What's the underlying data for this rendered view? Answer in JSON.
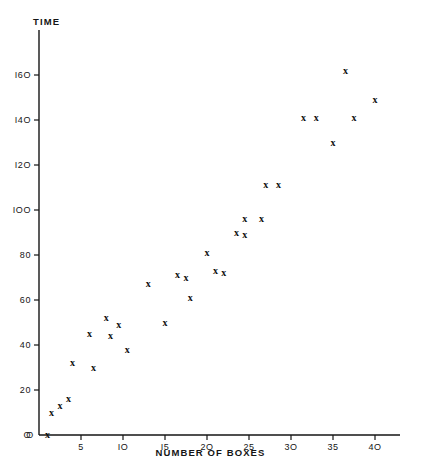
{
  "chart_data": {
    "type": "scatter",
    "title": "",
    "xlabel": "NUMBER OF BOXES",
    "ylabel": "TIME",
    "xlim": [
      0,
      43
    ],
    "ylim": [
      0,
      172
    ],
    "xticks": [
      0,
      5,
      10,
      15,
      20,
      25,
      30,
      35,
      40
    ],
    "xtick_labels": [
      "O",
      "5",
      "IO",
      "I5",
      "2O",
      "25",
      "3O",
      "35",
      "4O"
    ],
    "yticks": [
      0,
      20,
      40,
      60,
      80,
      100,
      120,
      140,
      160
    ],
    "ytick_labels": [
      "O",
      "20",
      "40",
      "60",
      "80",
      "IOO",
      "I2O",
      "I4O",
      "I6O"
    ],
    "grid": false,
    "legend": null,
    "marker": "x",
    "series": [
      {
        "name": "observations",
        "points": [
          [
            1.0,
            0.0
          ],
          [
            1.5,
            10.0
          ],
          [
            2.5,
            13.0
          ],
          [
            3.5,
            16.0
          ],
          [
            4.0,
            32.0
          ],
          [
            6.0,
            45.0
          ],
          [
            6.5,
            30.0
          ],
          [
            8.0,
            52.0
          ],
          [
            8.5,
            44.0
          ],
          [
            9.5,
            49.0
          ],
          [
            10.5,
            38.0
          ],
          [
            13.0,
            67.0
          ],
          [
            15.0,
            50.0
          ],
          [
            16.5,
            71.0
          ],
          [
            17.5,
            70.0
          ],
          [
            18.0,
            61.0
          ],
          [
            20.0,
            81.0
          ],
          [
            21.0,
            73.0
          ],
          [
            22.0,
            72.0
          ],
          [
            23.5,
            90.0
          ],
          [
            24.5,
            89.0
          ],
          [
            24.5,
            96.0
          ],
          [
            26.5,
            96.0
          ],
          [
            27.0,
            111.0
          ],
          [
            28.5,
            111.0
          ],
          [
            31.5,
            141.0
          ],
          [
            33.0,
            141.0
          ],
          [
            35.0,
            130.0
          ],
          [
            36.5,
            162.0
          ],
          [
            37.5,
            141.0
          ],
          [
            40.0,
            149.0
          ]
        ]
      }
    ]
  },
  "axes": {
    "y_axis_name": "time-axis",
    "x_axis_name": "boxes-axis"
  }
}
